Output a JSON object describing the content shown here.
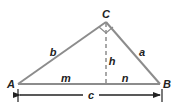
{
  "diagram": {
    "colors": {
      "line": "#8c8c8c",
      "text": "#222222",
      "background": "#ffffff"
    },
    "vertices": [
      {
        "name": "A",
        "label": "A"
      },
      {
        "name": "B",
        "label": "B"
      },
      {
        "name": "C",
        "label": "C"
      }
    ],
    "sides": [
      {
        "name": "b",
        "label": "b",
        "between": "A-C"
      },
      {
        "name": "a",
        "label": "a",
        "between": "C-B"
      },
      {
        "name": "c",
        "label": "c",
        "between": "A-B"
      }
    ],
    "altitude": {
      "label": "h",
      "from": "C",
      "style": "dashed"
    },
    "segments": [
      {
        "label": "m",
        "part": "A to foot of altitude"
      },
      {
        "label": "n",
        "part": "foot of altitude to B"
      }
    ],
    "right_angle_at": "C",
    "dimension_line": {
      "label": "c",
      "arrows": "both"
    }
  }
}
